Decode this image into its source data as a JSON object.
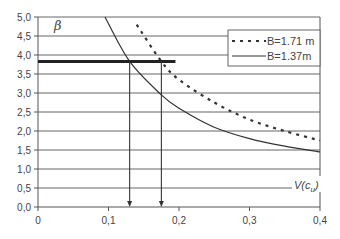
{
  "chart_data": {
    "type": "line",
    "title": "",
    "xlabel": "V(c_u)",
    "ylabel": "β",
    "xlim": [
      0,
      0.4
    ],
    "ylim": [
      0,
      5.0
    ],
    "x_ticks": [
      "0",
      "0,1",
      "0,2",
      "0,3",
      "0,4"
    ],
    "y_ticks": [
      "0,0",
      "0,5",
      "1,0",
      "1,5",
      "2,0",
      "2,5",
      "3,0",
      "3,5",
      "4,0",
      "4,5",
      "5,0"
    ],
    "grid": "horizontal",
    "legend_position": "upper right",
    "series": [
      {
        "name": "B=1.71 m",
        "style": "dotted",
        "x": [
          0.14,
          0.175,
          0.2,
          0.25,
          0.3,
          0.35,
          0.4
        ],
        "y": [
          4.8,
          3.83,
          3.35,
          2.75,
          2.3,
          2.0,
          1.75
        ]
      },
      {
        "name": "B=1.37m",
        "style": "solid",
        "x": [
          0.095,
          0.13,
          0.175,
          0.2,
          0.25,
          0.3,
          0.35,
          0.4
        ],
        "y": [
          5.0,
          3.83,
          2.95,
          2.6,
          2.1,
          1.8,
          1.6,
          1.45
        ]
      }
    ],
    "annotations": [
      {
        "type": "horizontal-line",
        "y": 3.83,
        "x_from": 0,
        "x_to": 0.195,
        "style": "thick"
      },
      {
        "type": "arrow-down",
        "x": 0.13,
        "from_y": 3.83,
        "to_y": 0
      },
      {
        "type": "arrow-down",
        "x": 0.175,
        "from_y": 3.83,
        "to_y": 0
      }
    ]
  },
  "labels": {
    "beta": "β",
    "xlabel_main": "V(c",
    "xlabel_sub": "u",
    "xlabel_close": ")",
    "legend_dotted": "B=1.71 m",
    "legend_solid": "B=1.37m"
  }
}
